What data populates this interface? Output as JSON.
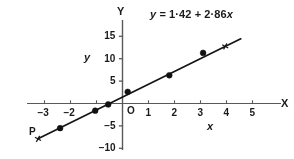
{
  "chart_data": {
    "type": "scatter",
    "title": "",
    "annotation": "y = 1·42 + 2·86x",
    "equation": {
      "lhs": "y",
      "equals": "=",
      "intercept": "1·42",
      "plus": "+",
      "slope": "2·86",
      "variable": "x",
      "intercept_value": 1.42,
      "slope_value": 2.86
    },
    "xlabel": "x",
    "ylabel": "y",
    "x_axis_letter": "X",
    "y_axis_letter": "Y",
    "origin_label": "O",
    "xlim": [
      -3.6,
      5.7
    ],
    "ylim": [
      -11.0,
      17.0
    ],
    "xticks": [
      -3,
      -2,
      -1,
      1,
      2,
      3,
      4,
      5
    ],
    "xtick_labels": [
      "−3",
      "−2",
      "",
      "1",
      "2",
      "3",
      "4",
      "5"
    ],
    "yticks": [
      -10,
      -5,
      5,
      10,
      15
    ],
    "ytick_labels": [
      "−10",
      "−5",
      "5",
      "10",
      "15"
    ],
    "grid": false,
    "legend": false,
    "points": [
      {
        "x": -2.4,
        "y": -5.5
      },
      {
        "x": -1.05,
        "y": -1.6
      },
      {
        "x": -0.55,
        "y": -0.2
      },
      {
        "x": 0.2,
        "y": 2.6
      },
      {
        "x": 1.8,
        "y": 6.3
      },
      {
        "x": 3.1,
        "y": 11.3
      }
    ],
    "line": {
      "name": "regression line",
      "x_start": -3.25,
      "x_end": 4.55,
      "style": "solid"
    },
    "markers": [
      {
        "name": "P",
        "x": -3.25,
        "y": -7.9,
        "label": "P",
        "glyph": "cross"
      },
      {
        "name": "upper-cross",
        "x": 3.95,
        "y": 12.75,
        "label": "",
        "glyph": "cross"
      }
    ],
    "colors": {
      "ink": "#1a1a1a",
      "axis": "#555555",
      "point": "#111111",
      "background": "#ffffff"
    }
  }
}
